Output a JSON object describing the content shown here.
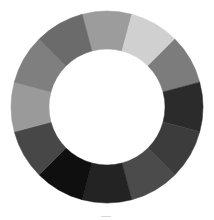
{
  "ring": {
    "center": [
      107,
      107
    ],
    "outer_radius": 96,
    "inner_radius": 58,
    "start_angle_deg": -15,
    "segments": [
      {
        "color": "#9c9c9c"
      },
      {
        "color": "#d0d0d0"
      },
      {
        "color": "#7c7c7c"
      },
      {
        "color": "#2b2b2b"
      },
      {
        "color": "#3c3c3c"
      },
      {
        "color": "#4b4b4b"
      },
      {
        "color": "#232323"
      },
      {
        "color": "#0f0f0f"
      },
      {
        "color": "#474747"
      },
      {
        "color": "#9a9a9a"
      },
      {
        "color": "#7f7f7f"
      },
      {
        "color": "#6b6b6b"
      }
    ]
  }
}
